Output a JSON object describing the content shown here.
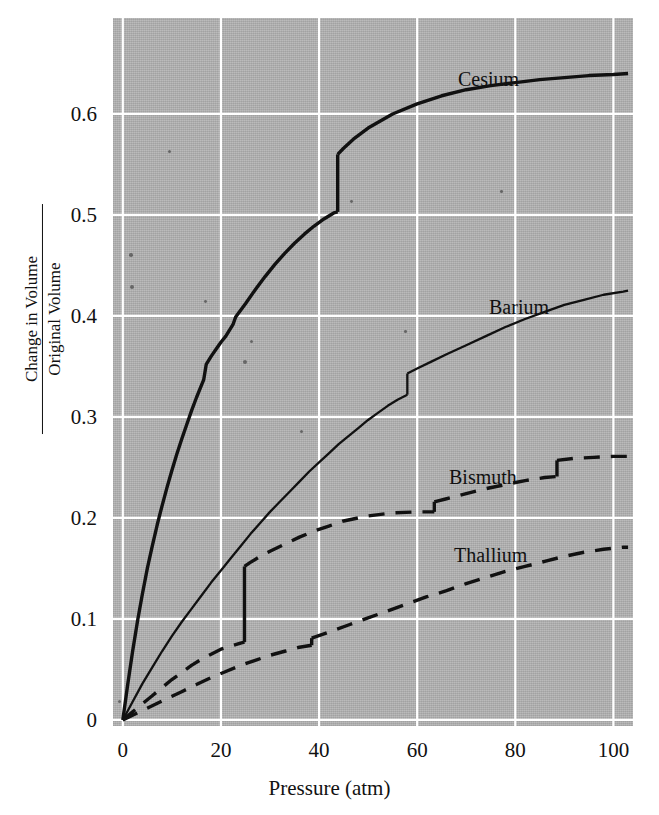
{
  "figure": {
    "background_color": "#ffffff",
    "plot_background_color": "#b4b4b4",
    "gridline_color": "#ffffff",
    "ink_color": "#111111"
  },
  "axes": {
    "x": {
      "label": "Pressure (atm)",
      "ticks": [
        "0",
        "20",
        "40",
        "60",
        "80",
        "100"
      ],
      "tick_values": [
        0,
        20,
        40,
        60,
        80,
        100
      ],
      "range": [
        -2,
        104
      ]
    },
    "y": {
      "label_numerator": "Change in Volume",
      "label_denominator": "Original Volume",
      "ticks": [
        "0",
        "0.1",
        "0.2",
        "0.3",
        "0.4",
        "0.5",
        "0.6"
      ],
      "tick_values": [
        0,
        0.1,
        0.2,
        0.3,
        0.4,
        0.5,
        0.6
      ],
      "range": [
        -0.006,
        0.695
      ]
    }
  },
  "series_labels": [
    {
      "name": "cesium-label",
      "text": "Cesium",
      "x_px": 458,
      "y_px": 68
    },
    {
      "name": "barium-label",
      "text": "Barium",
      "x_px": 489,
      "y_px": 296
    },
    {
      "name": "bismuth-label",
      "text": "Bismuth",
      "x_px": 449,
      "y_px": 466
    },
    {
      "name": "thallium-label",
      "text": "Thallium",
      "x_px": 454,
      "y_px": 544
    }
  ],
  "chart_data": {
    "type": "line",
    "title": "",
    "xlabel": "Pressure (atm)",
    "ylabel": "Change in Volume / Original Volume",
    "xlim": [
      -2,
      104
    ],
    "ylim": [
      -0.006,
      0.695
    ],
    "grid": true,
    "legend": "inline-labels",
    "series": [
      {
        "name": "Cesium",
        "style": "solid",
        "linewidth": 3.4,
        "has_phase_transition": true,
        "transition_pressure_atm": 43.8,
        "transition_from": 0.503,
        "transition_to": 0.56,
        "points": [
          [
            0,
            0.0
          ],
          [
            1,
            0.035
          ],
          [
            2,
            0.068
          ],
          [
            3,
            0.098
          ],
          [
            4,
            0.125
          ],
          [
            5,
            0.15
          ],
          [
            6,
            0.172
          ],
          [
            7,
            0.193
          ],
          [
            8,
            0.212
          ],
          [
            9,
            0.23
          ],
          [
            10,
            0.247
          ],
          [
            11,
            0.263
          ],
          [
            12,
            0.278
          ],
          [
            13,
            0.292
          ],
          [
            14,
            0.306
          ],
          [
            15,
            0.319
          ],
          [
            16,
            0.331
          ],
          [
            16.5,
            0.337
          ],
          [
            17,
            0.352
          ],
          [
            18,
            0.36
          ],
          [
            19,
            0.367
          ],
          [
            20,
            0.374
          ],
          [
            21,
            0.38
          ],
          [
            22,
            0.388
          ],
          [
            22.5,
            0.392
          ],
          [
            23,
            0.399
          ],
          [
            25,
            0.412
          ],
          [
            27,
            0.426
          ],
          [
            29,
            0.439
          ],
          [
            31,
            0.451
          ],
          [
            33,
            0.462
          ],
          [
            35,
            0.472
          ],
          [
            37,
            0.481
          ],
          [
            39,
            0.489
          ],
          [
            41,
            0.496
          ],
          [
            43,
            0.502
          ],
          [
            43.8,
            0.503
          ],
          [
            43.8,
            0.56
          ],
          [
            45,
            0.566
          ],
          [
            47,
            0.575
          ],
          [
            50,
            0.586
          ],
          [
            55,
            0.6
          ],
          [
            60,
            0.61
          ],
          [
            65,
            0.618
          ],
          [
            70,
            0.624
          ],
          [
            75,
            0.628
          ],
          [
            80,
            0.631
          ],
          [
            85,
            0.634
          ],
          [
            90,
            0.636
          ],
          [
            95,
            0.638
          ],
          [
            100,
            0.639
          ],
          [
            103,
            0.64
          ]
        ]
      },
      {
        "name": "Barium",
        "style": "solid",
        "linewidth": 2.3,
        "has_phase_transition": true,
        "transition_pressure_atm": 58.0,
        "transition_from": 0.322,
        "transition_to": 0.343,
        "points": [
          [
            0,
            0.0
          ],
          [
            2,
            0.018
          ],
          [
            4,
            0.036
          ],
          [
            6,
            0.052
          ],
          [
            8,
            0.068
          ],
          [
            10,
            0.083
          ],
          [
            12,
            0.097
          ],
          [
            14,
            0.11
          ],
          [
            16,
            0.123
          ],
          [
            18,
            0.136
          ],
          [
            20,
            0.148
          ],
          [
            22,
            0.16
          ],
          [
            24,
            0.172
          ],
          [
            26,
            0.184
          ],
          [
            28,
            0.195
          ],
          [
            30,
            0.206
          ],
          [
            32,
            0.216
          ],
          [
            34,
            0.226
          ],
          [
            36,
            0.236
          ],
          [
            38,
            0.246
          ],
          [
            40,
            0.255
          ],
          [
            42,
            0.264
          ],
          [
            44,
            0.273
          ],
          [
            46,
            0.281
          ],
          [
            48,
            0.289
          ],
          [
            50,
            0.297
          ],
          [
            52,
            0.304
          ],
          [
            54,
            0.311
          ],
          [
            56,
            0.317
          ],
          [
            58,
            0.322
          ],
          [
            58,
            0.343
          ],
          [
            60,
            0.348
          ],
          [
            63,
            0.355
          ],
          [
            66,
            0.362
          ],
          [
            70,
            0.371
          ],
          [
            74,
            0.38
          ],
          [
            78,
            0.389
          ],
          [
            82,
            0.397
          ],
          [
            86,
            0.404
          ],
          [
            90,
            0.411
          ],
          [
            94,
            0.416
          ],
          [
            98,
            0.421
          ],
          [
            102,
            0.424
          ],
          [
            103,
            0.425
          ]
        ]
      },
      {
        "name": "Bismuth",
        "style": "dashed",
        "linewidth": 3.4,
        "has_phase_transition": true,
        "transition_pressure_atm": 24.8,
        "transition_from": 0.077,
        "transition_to": 0.152,
        "secondary_transitions": [
          {
            "pressure_atm": 63.5,
            "from": 0.206,
            "to": 0.216
          },
          {
            "pressure_atm": 88.5,
            "from": 0.241,
            "to": 0.257
          }
        ],
        "points": [
          [
            0,
            0.0
          ],
          [
            2,
            0.008
          ],
          [
            4,
            0.016
          ],
          [
            6,
            0.024
          ],
          [
            8,
            0.032
          ],
          [
            10,
            0.04
          ],
          [
            12,
            0.047
          ],
          [
            14,
            0.054
          ],
          [
            16,
            0.06
          ],
          [
            18,
            0.065
          ],
          [
            20,
            0.07
          ],
          [
            22,
            0.073
          ],
          [
            24,
            0.076
          ],
          [
            24.8,
            0.077
          ],
          [
            24.8,
            0.152
          ],
          [
            26,
            0.156
          ],
          [
            28,
            0.162
          ],
          [
            30,
            0.167
          ],
          [
            33,
            0.174
          ],
          [
            36,
            0.181
          ],
          [
            39,
            0.187
          ],
          [
            42,
            0.192
          ],
          [
            45,
            0.197
          ],
          [
            48,
            0.2
          ],
          [
            50,
            0.202
          ],
          [
            55,
            0.205
          ],
          [
            60,
            0.206
          ],
          [
            63.5,
            0.206
          ],
          [
            63.5,
            0.216
          ],
          [
            66,
            0.219
          ],
          [
            70,
            0.224
          ],
          [
            74,
            0.229
          ],
          [
            78,
            0.233
          ],
          [
            82,
            0.237
          ],
          [
            86,
            0.24
          ],
          [
            88.5,
            0.241
          ],
          [
            88.5,
            0.257
          ],
          [
            92,
            0.259
          ],
          [
            96,
            0.26
          ],
          [
            100,
            0.261
          ],
          [
            103,
            0.261
          ]
        ]
      },
      {
        "name": "Thallium",
        "style": "dashed",
        "linewidth": 3.4,
        "has_phase_transition": true,
        "transition_pressure_atm": 38.5,
        "transition_from": 0.074,
        "transition_to": 0.081,
        "points": [
          [
            0,
            0.0
          ],
          [
            3,
            0.007
          ],
          [
            6,
            0.014
          ],
          [
            9,
            0.021
          ],
          [
            12,
            0.028
          ],
          [
            15,
            0.035
          ],
          [
            18,
            0.042
          ],
          [
            21,
            0.048
          ],
          [
            24,
            0.054
          ],
          [
            27,
            0.059
          ],
          [
            30,
            0.064
          ],
          [
            33,
            0.068
          ],
          [
            36,
            0.072
          ],
          [
            38.5,
            0.074
          ],
          [
            38.5,
            0.081
          ],
          [
            42,
            0.087
          ],
          [
            46,
            0.094
          ],
          [
            50,
            0.101
          ],
          [
            54,
            0.108
          ],
          [
            58,
            0.115
          ],
          [
            62,
            0.122
          ],
          [
            66,
            0.128
          ],
          [
            70,
            0.135
          ],
          [
            74,
            0.141
          ],
          [
            78,
            0.147
          ],
          [
            82,
            0.152
          ],
          [
            86,
            0.157
          ],
          [
            90,
            0.162
          ],
          [
            94,
            0.166
          ],
          [
            98,
            0.169
          ],
          [
            102,
            0.171
          ],
          [
            103,
            0.171
          ]
        ]
      }
    ]
  }
}
